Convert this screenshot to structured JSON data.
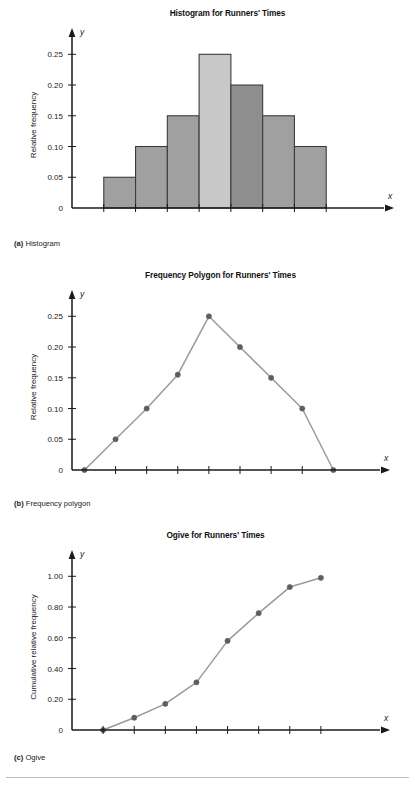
{
  "figure": {
    "panels": [
      {
        "key": "a",
        "caption_tag": "(a)",
        "caption_text": "Histogram",
        "title": "Histogram for Runners' Times"
      },
      {
        "key": "b",
        "caption_tag": "(b)",
        "caption_text": "Frequency polygon",
        "title": "Frequency Polygon for Runners' Times"
      },
      {
        "key": "c",
        "caption_tag": "(c)",
        "caption_text": "Ogive",
        "title": "Ogive for Runners' Times"
      }
    ]
  },
  "style": {
    "bar_fill": "#a0a0a0",
    "bar_fill_light": "#c8c8c8",
    "bar_fill_dark": "#8e8e8e",
    "bar_stroke": "#3c3c3c",
    "line_color": "#9a9a9a",
    "marker_color": "#5a5f66",
    "axis_color": "#1a1a1a",
    "rule_color": "#b9bcc2"
  },
  "chart_data": [
    {
      "type": "bar",
      "title": "Histogram for Runners' Times",
      "xlabel": "Miles",
      "ylabel": "Relative frequency",
      "x_axis_var": "x",
      "y_axis_var": "y",
      "xticks": [
        "5.5",
        "10.5",
        "15.5",
        "20.5",
        "25.5",
        "30.5",
        "35.5",
        "40.5"
      ],
      "xtick_values": [
        5.5,
        10.5,
        15.5,
        20.5,
        25.5,
        30.5,
        35.5,
        40.5
      ],
      "yticks": [
        "0",
        "0.05",
        "0.10",
        "0.15",
        "0.20",
        "0.25"
      ],
      "ytick_values": [
        0,
        0.05,
        0.1,
        0.15,
        0.2,
        0.25
      ],
      "ylim": [
        0,
        0.27
      ],
      "xlim": [
        0.5,
        45.5
      ],
      "grid": false,
      "legend": "none",
      "bins": [
        {
          "left": 5.5,
          "right": 10.5,
          "value": 0.05,
          "shade": "mid"
        },
        {
          "left": 10.5,
          "right": 15.5,
          "value": 0.1,
          "shade": "mid"
        },
        {
          "left": 15.5,
          "right": 20.5,
          "value": 0.15,
          "shade": "mid"
        },
        {
          "left": 20.5,
          "right": 25.5,
          "value": 0.25,
          "shade": "light"
        },
        {
          "left": 25.5,
          "right": 30.5,
          "value": 0.2,
          "shade": "dark"
        },
        {
          "left": 30.5,
          "right": 35.5,
          "value": 0.15,
          "shade": "mid"
        },
        {
          "left": 35.5,
          "right": 40.5,
          "value": 0.1,
          "shade": "mid"
        }
      ]
    },
    {
      "type": "line",
      "title": "Frequency Polygon for Runners' Times",
      "xlabel": "Miles",
      "ylabel": "Relative frequency",
      "x_axis_var": "x",
      "y_axis_var": "y",
      "xticks": [
        "8",
        "13",
        "18",
        "23",
        "28",
        "33",
        "38"
      ],
      "xtick_values": [
        8,
        13,
        18,
        23,
        28,
        33,
        38
      ],
      "yticks": [
        "0",
        "0.05",
        "0.10",
        "0.15",
        "0.20",
        "0.25"
      ],
      "ytick_values": [
        0,
        0.05,
        0.1,
        0.15,
        0.2,
        0.25
      ],
      "ylim": [
        0,
        0.27
      ],
      "xlim": [
        1,
        46
      ],
      "grid": false,
      "legend": "none",
      "markers": true,
      "x": [
        3,
        8,
        13,
        18,
        23,
        28,
        33,
        38,
        43
      ],
      "values": [
        0,
        0.05,
        0.1,
        0.155,
        0.25,
        0.2,
        0.15,
        0.1,
        0
      ]
    },
    {
      "type": "line",
      "title": "Ogive for Runners' Times",
      "xlabel": "Miles",
      "ylabel": "Cumulative relative frequency",
      "x_axis_var": "x",
      "y_axis_var": "y",
      "xticks": [
        "5.5",
        "10.5",
        "15.5",
        "20.5",
        "25.5",
        "30.5",
        "35.5",
        "40.5"
      ],
      "xtick_values": [
        5.5,
        10.5,
        15.5,
        20.5,
        25.5,
        30.5,
        35.5,
        40.5
      ],
      "yticks": [
        "0",
        "0.20",
        "0.40",
        "0.60",
        "0.80",
        "1.00"
      ],
      "ytick_values": [
        0,
        0.2,
        0.4,
        0.6,
        0.8,
        1.0
      ],
      "ylim": [
        0,
        1.08
      ],
      "xlim": [
        0.5,
        45.5
      ],
      "grid": false,
      "legend": "none",
      "markers": true,
      "x": [
        5.5,
        10.5,
        15.5,
        20.5,
        25.5,
        30.5,
        35.5,
        40.5
      ],
      "values": [
        0,
        0.08,
        0.17,
        0.31,
        0.58,
        0.76,
        0.93,
        0.99
      ]
    }
  ]
}
